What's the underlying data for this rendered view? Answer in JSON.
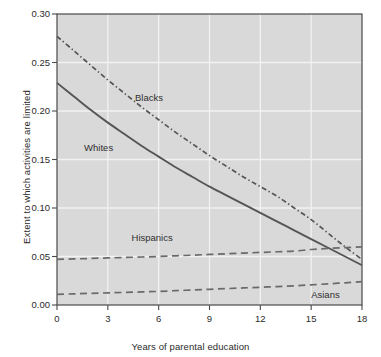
{
  "chart_data": {
    "type": "line",
    "title": "",
    "subtitle": "",
    "xlabel": "Years of parental education",
    "ylabel": "Extent to which activities are limited",
    "xlim": [
      0,
      18
    ],
    "ylim": [
      0.0,
      0.3
    ],
    "xticks": [
      "0",
      "3",
      "6",
      "9",
      "12",
      "15",
      "18"
    ],
    "xtick_values": [
      0,
      3,
      6,
      9,
      12,
      15,
      18
    ],
    "yticks": [
      "0.00",
      "0.05",
      "0.10",
      "0.15",
      "0.20",
      "0.25",
      "0.30"
    ],
    "ytick_values": [
      0.0,
      0.05,
      0.1,
      0.15,
      0.2,
      0.25,
      0.3
    ],
    "grid": true,
    "grid_color": "#f2f2f2",
    "plot_bgcolor": "#d9d9d9",
    "legend_position": "inline-annotations",
    "x": [
      0,
      1,
      2,
      3,
      4,
      5,
      6,
      7,
      8,
      9,
      10,
      11,
      12,
      13,
      14,
      15,
      16,
      17,
      18
    ],
    "series": [
      {
        "name": "Blacks",
        "style": "dash-dot",
        "color": "#555555",
        "label_x": 4.6,
        "label_y": 0.212,
        "values": [
          0.277,
          0.262,
          0.247,
          0.232,
          0.218,
          0.204,
          0.191,
          0.178,
          0.166,
          0.154,
          0.143,
          0.132,
          0.122,
          0.112,
          0.1,
          0.088,
          0.074,
          0.06,
          0.047
        ]
      },
      {
        "name": "Whites",
        "style": "solid",
        "color": "#555555",
        "label_x": 1.6,
        "label_y": 0.161,
        "values": [
          0.229,
          0.215,
          0.201,
          0.188,
          0.176,
          0.164,
          0.153,
          0.142,
          0.132,
          0.122,
          0.113,
          0.104,
          0.095,
          0.086,
          0.077,
          0.068,
          0.059,
          0.05,
          0.041
        ]
      },
      {
        "name": "Hispanics",
        "style": "dashed",
        "color": "#6a6a6a",
        "label_x": 4.4,
        "label_y": 0.068,
        "values": [
          0.047,
          0.0475,
          0.048,
          0.0485,
          0.049,
          0.0495,
          0.05,
          0.0507,
          0.0514,
          0.0521,
          0.0528,
          0.0535,
          0.0542,
          0.0549,
          0.0556,
          0.0572,
          0.0583,
          0.0592,
          0.06
        ]
      },
      {
        "name": "Asians",
        "style": "dashed",
        "color": "#6a6a6a",
        "label_x": 15.0,
        "label_y": 0.0095,
        "values": [
          0.011,
          0.0115,
          0.012,
          0.0125,
          0.013,
          0.0135,
          0.014,
          0.0148,
          0.0155,
          0.0162,
          0.0169,
          0.0176,
          0.0183,
          0.019,
          0.0198,
          0.0208,
          0.0218,
          0.0229,
          0.024
        ]
      }
    ]
  },
  "axes": {
    "xlabel": "Years of parental education",
    "ylabel": "Extent to which activities are limited"
  }
}
